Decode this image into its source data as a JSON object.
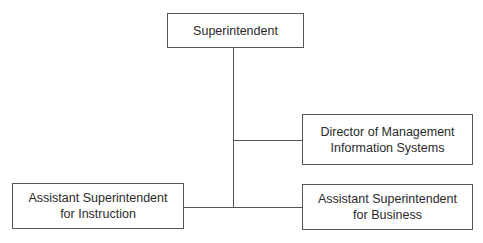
{
  "org_chart": {
    "top": {
      "label": "Superintendent"
    },
    "staff": {
      "line1": "Director of Management",
      "line2": "Information Systems"
    },
    "left": {
      "line1": "Assistant Superintendent",
      "line2": "for Instruction"
    },
    "right": {
      "line1": "Assistant Superintendent",
      "line2": "for Business"
    }
  }
}
